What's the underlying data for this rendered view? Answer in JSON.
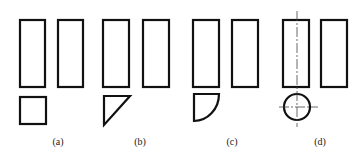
{
  "diagram": {
    "panels": [
      {
        "label": "(a)",
        "section_shape": "square",
        "rectangles": [
          {
            "x": 20,
            "y": 20,
            "w": 25,
            "h": 67
          },
          {
            "x": 58,
            "y": 20,
            "w": 25,
            "h": 67
          }
        ],
        "section": {
          "x": 20,
          "y": 97,
          "w": 26,
          "h": 27
        },
        "label_pos": {
          "x": 58,
          "y": 145
        }
      },
      {
        "label": "(b)",
        "section_shape": "right-triangle",
        "rectangles": [
          {
            "x": 103,
            "y": 20,
            "w": 26,
            "h": 67
          },
          {
            "x": 143,
            "y": 20,
            "w": 26,
            "h": 67
          }
        ],
        "section": {
          "points": "104,96 130,96 104,125"
        },
        "label_pos": {
          "x": 140,
          "y": 145
        }
      },
      {
        "label": "(c)",
        "section_shape": "quarter-circle",
        "rectangles": [
          {
            "x": 193,
            "y": 20,
            "w": 26,
            "h": 67
          },
          {
            "x": 232,
            "y": 20,
            "w": 26,
            "h": 67
          }
        ],
        "section": {
          "d": "M194,94 L219,94 A25,27 0 0 1 194,121 Z"
        },
        "label_pos": {
          "x": 232,
          "y": 145
        }
      },
      {
        "label": "(d)",
        "section_shape": "circle",
        "rectangles": [
          {
            "x": 283,
            "y": 20,
            "w": 26,
            "h": 67
          },
          {
            "x": 321,
            "y": 20,
            "w": 26,
            "h": 67
          }
        ],
        "section": {
          "cx": 297,
          "cy": 107,
          "r": 13
        },
        "centerlines": {
          "vertical": {
            "x": 297,
            "y1": 11,
            "y2": 127
          },
          "horizontal": {
            "y": 107,
            "x1": 279,
            "x2": 318
          }
        },
        "label_pos": {
          "x": 320,
          "y": 145
        }
      }
    ]
  }
}
